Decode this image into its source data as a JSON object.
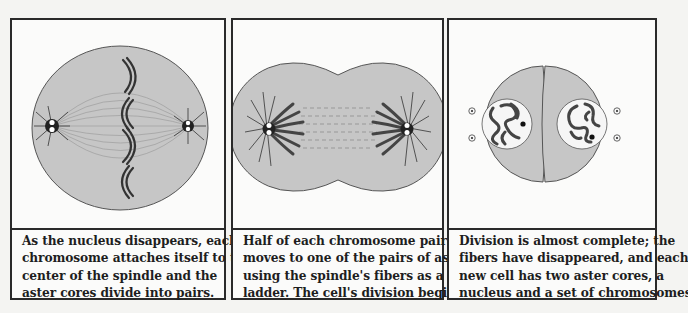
{
  "colors": {
    "cell_fill": "#c6c6c6",
    "cell_outline": "#555555",
    "chromosome": "#3a3a3a",
    "panel_border": "#2a2a2a",
    "background": "#f4f4f2",
    "nucleus_fill": "#f6f6f6"
  },
  "panels": [
    {
      "stage": "metaphase",
      "caption_lines": [
        "As the nucleus disappears, each",
        "chromosome attaches itself to the",
        "center of the spindle and the",
        "aster cores divide into pairs."
      ],
      "figure": {
        "elements": [
          "cell-circle",
          "spindle-fibers",
          "aster-left",
          "aster-right",
          "chromosome-pairs-x4"
        ]
      }
    },
    {
      "stage": "anaphase",
      "caption_lines": [
        "Half of each chromosome pair",
        "moves to one of the pairs of asters,",
        "using the spindle's fibers as a",
        "ladder. The cell's division begins."
      ],
      "figure": {
        "elements": [
          "pinching-cell",
          "spindle-fibers",
          "aster-left",
          "aster-right",
          "chromosome-fan-left",
          "chromosome-fan-right"
        ]
      }
    },
    {
      "stage": "telophase",
      "caption_lines": [
        "Division is almost complete; the",
        "fibers have disappeared, and each",
        "new cell has two aster cores, a",
        "nucleus and a set of chromosomes."
      ],
      "figure": {
        "elements": [
          "daughter-cell-left",
          "daughter-cell-right",
          "nucleus-left",
          "nucleus-right",
          "aster-cores-x4"
        ]
      }
    }
  ]
}
